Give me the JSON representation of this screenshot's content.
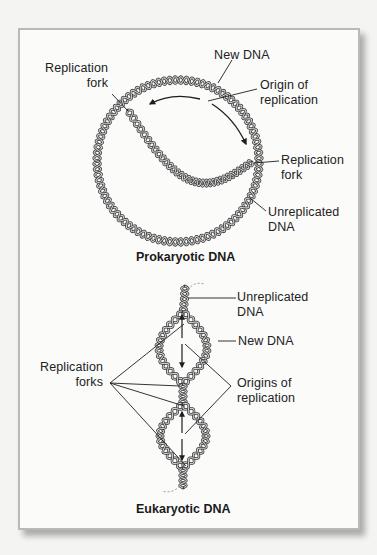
{
  "figure": {
    "colors": {
      "background": "#f4f4f3",
      "panel": "#fbfbfa",
      "border": "#b9b9b9",
      "strand_outline": "#3a3a3a",
      "strand_fill": "#cfcfcf",
      "leader_line": "#1e1e1e",
      "text": "#222222"
    },
    "prokaryotic": {
      "title": "Prokaryotic DNA",
      "labels": {
        "replication_fork_left": [
          "Replication",
          "fork"
        ],
        "new_dna": "New DNA",
        "origin": [
          "Origin of",
          "replication"
        ],
        "replication_fork_right": [
          "Replication",
          "fork"
        ],
        "unreplicated": [
          "Unreplicated",
          "DNA"
        ]
      },
      "circle": {
        "cx": 178,
        "cy": 161,
        "r": 81
      }
    },
    "eukaryotic": {
      "title": "Eukaryotic DNA",
      "labels": {
        "unreplicated": [
          "Unreplicated",
          "DNA"
        ],
        "new_dna": "New DNA",
        "replication_forks": [
          "Replication",
          "forks"
        ],
        "origins": [
          "Origins of",
          "replication"
        ]
      }
    }
  }
}
